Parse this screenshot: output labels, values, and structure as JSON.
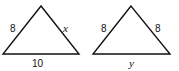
{
  "figure": {
    "stroke_color": "#111111",
    "background": "#ffffff",
    "triangles": [
      {
        "name": "triangle-left",
        "left_side": "8",
        "right_side": "x",
        "base": "10"
      },
      {
        "name": "triangle-right",
        "left_side": "8",
        "right_side": "8",
        "base": "y"
      }
    ]
  }
}
